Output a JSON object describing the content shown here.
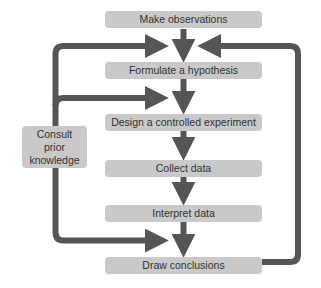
{
  "diagram": {
    "type": "flowchart",
    "colors": {
      "background": "#ffffff",
      "box_fill": "#c9c9c9",
      "arrow": "#555555",
      "text": "#333333"
    },
    "steps": [
      {
        "id": "s1",
        "label": "Make observations"
      },
      {
        "id": "s2",
        "label": "Formulate a hypothesis"
      },
      {
        "id": "s3",
        "label": "Design a controlled experiment"
      },
      {
        "id": "s4",
        "label": "Collect data"
      },
      {
        "id": "s5",
        "label": "Interpret data"
      },
      {
        "id": "s6",
        "label": "Draw conclusions"
      }
    ],
    "side_box": {
      "id": "consult",
      "lines": [
        "Consult",
        "prior",
        "knowledge"
      ]
    },
    "edges": [
      {
        "from": "s1",
        "to": "s2"
      },
      {
        "from": "s2",
        "to": "s3"
      },
      {
        "from": "s3",
        "to": "s4"
      },
      {
        "from": "s4",
        "to": "s5"
      },
      {
        "from": "s5",
        "to": "s6"
      },
      {
        "from": "consult",
        "to": "s2",
        "note": "enters arrow between s1 and s2"
      },
      {
        "from": "consult",
        "to": "s3",
        "note": "enters arrow between s2 and s3"
      },
      {
        "from": "consult",
        "to": "s6",
        "note": "enters arrow between s5 and s6"
      },
      {
        "from": "s6",
        "to": "s2",
        "note": "feedback loop on right side"
      }
    ]
  }
}
